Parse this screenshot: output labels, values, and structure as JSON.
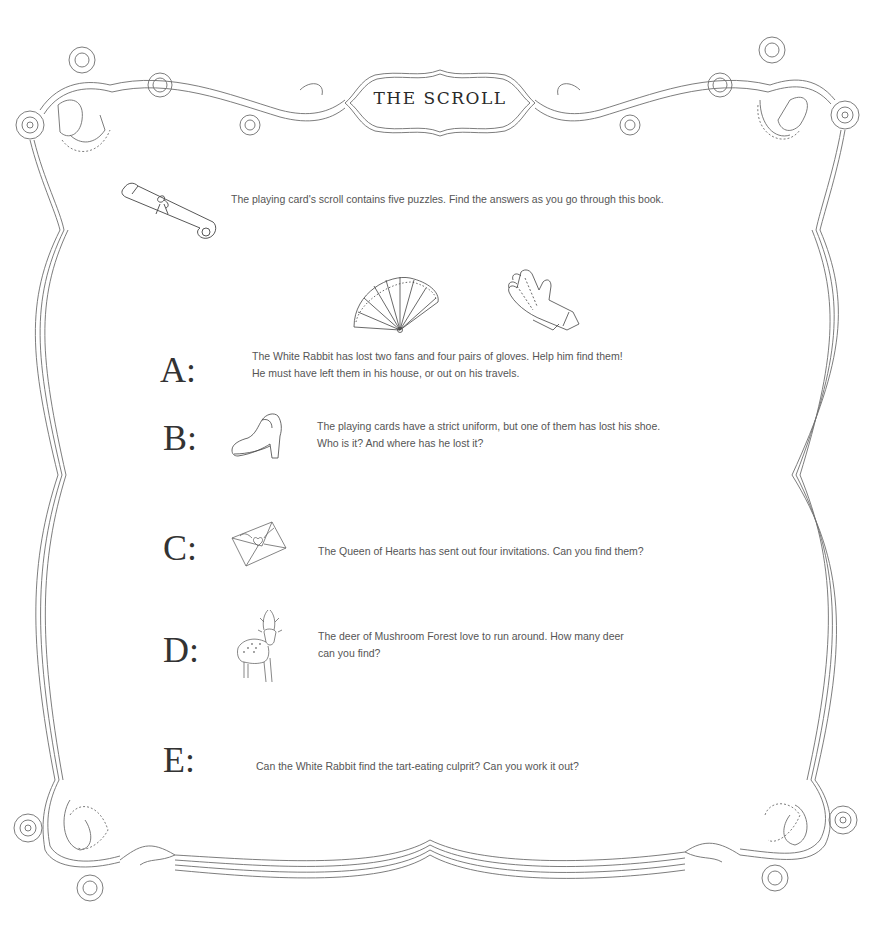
{
  "page": {
    "title": "THE SCROLL",
    "intro": {
      "icon": "scroll-icon",
      "text": "The playing card's scroll contains five puzzles. Find the answers as you go through this book."
    },
    "puzzles": [
      {
        "letter": "A:",
        "icons": [
          "fan-icon",
          "gloves-icon"
        ],
        "lines": [
          "The White Rabbit has lost two fans and four pairs of gloves. Help him find them!",
          "He must have left them in his house, or out on his travels."
        ]
      },
      {
        "letter": "B:",
        "icons": [
          "shoe-icon"
        ],
        "lines": [
          "The playing cards have a strict uniform, but one of them has lost his shoe.",
          "Who is it? And where has he lost it?"
        ]
      },
      {
        "letter": "C:",
        "icons": [
          "envelope-icon"
        ],
        "lines": [
          "The Queen of Hearts has sent out four invitations. Can you find them?"
        ]
      },
      {
        "letter": "D:",
        "icons": [
          "deer-icon"
        ],
        "lines": [
          "The deer of Mushroom Forest love to run around. How many deer",
          "can you find?"
        ]
      },
      {
        "letter": "E:",
        "icons": [],
        "lines": [
          "Can the White Rabbit find the tart-eating culprit? Can you work it out?"
        ]
      }
    ]
  },
  "colors": {
    "line": "#6e6e6e",
    "title_text": "#2a2a2a",
    "body_text": "#555555",
    "background": "#ffffff"
  }
}
